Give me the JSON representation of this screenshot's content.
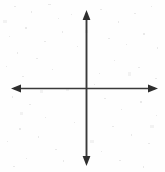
{
  "figure": {
    "kind": "cartesian-axes-diagram",
    "title": "",
    "background_color": "#fefefe",
    "line_color": "#3a3a3a",
    "arrow_color": "#2e2e2e",
    "width_px": 165,
    "height_px": 172
  },
  "chart_data": {
    "type": "line",
    "title": "",
    "subtitle": "",
    "xlabel": "",
    "ylabel": "",
    "series": [],
    "categories": [],
    "x": [],
    "values": [],
    "xlim": [
      -1,
      1
    ],
    "ylim": [
      -1,
      1
    ],
    "grid": false,
    "legend": false,
    "legend_position": "none",
    "annotations": [],
    "axes": {
      "origin": {
        "x": 86,
        "y": 88
      },
      "x_axis": {
        "name": "horizontal-axis",
        "start_x": 11,
        "end_x": 158,
        "y": 88,
        "arrow_start": true,
        "arrow_end": true,
        "tick_labels": [],
        "label": ""
      },
      "y_axis": {
        "name": "vertical-axis",
        "x": 86,
        "start_y": 10,
        "end_y": 166,
        "arrow_start": true,
        "arrow_end": true,
        "tick_labels": [],
        "label": ""
      }
    }
  },
  "captions": {
    "x_positive": "",
    "x_negative": "",
    "y_positive": "",
    "y_negative": ""
  }
}
